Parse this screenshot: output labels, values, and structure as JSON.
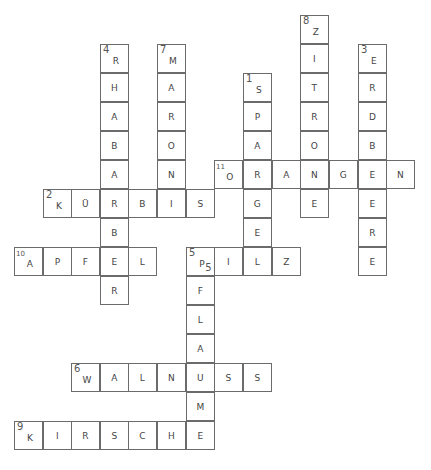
{
  "puzzle": {
    "type": "crossword",
    "grid": {
      "col_x": [
        14,
        43,
        71,
        100,
        128,
        157,
        186,
        214,
        243,
        272,
        300,
        329,
        358,
        386
      ],
      "row_y": [
        15,
        44,
        73,
        102,
        131,
        160,
        189,
        218,
        247,
        276,
        305,
        334,
        363,
        392,
        421
      ]
    },
    "words": [
      {
        "number": "1",
        "answer": "SPARGEL",
        "direction": "down",
        "start": [
          8,
          2
        ]
      },
      {
        "number": "2",
        "answer": "KÜRBIS",
        "direction": "across",
        "start": [
          1,
          6
        ]
      },
      {
        "number": "3",
        "answer": "ERDBEERE",
        "direction": "down",
        "start": [
          12,
          1
        ]
      },
      {
        "number": "4",
        "answer": "RHABARBER",
        "direction": "down",
        "start": [
          3,
          1
        ]
      },
      {
        "number": "5",
        "answer": "PILZ",
        "direction": "across",
        "start": [
          6,
          8
        ]
      },
      {
        "number": "5",
        "answer": "PFLAUME",
        "direction": "down",
        "start": [
          6,
          8
        ]
      },
      {
        "number": "6",
        "answer": "WALNUSS",
        "direction": "across",
        "start": [
          2,
          12
        ]
      },
      {
        "number": "7",
        "answer": "MARONI",
        "direction": "down",
        "start": [
          5,
          1
        ]
      },
      {
        "number": "8",
        "answer": "ZITRONE",
        "direction": "down",
        "start": [
          10,
          0
        ]
      },
      {
        "number": "9",
        "answer": "KIRSCHE",
        "direction": "across",
        "start": [
          0,
          14
        ]
      },
      {
        "number": "10",
        "answer": "APFEL",
        "direction": "across",
        "start": [
          0,
          8
        ]
      },
      {
        "number": "11",
        "answer": "ORANGEN",
        "direction": "across",
        "start": [
          7,
          5
        ]
      }
    ],
    "cells": [
      {
        "c": 10,
        "r": 0,
        "l": "Z",
        "n": "8"
      },
      {
        "c": 3,
        "r": 1,
        "l": "R",
        "n": "4"
      },
      {
        "c": 5,
        "r": 1,
        "l": "M",
        "n": "7"
      },
      {
        "c": 10,
        "r": 1,
        "l": "I"
      },
      {
        "c": 12,
        "r": 1,
        "l": "E",
        "n": "3"
      },
      {
        "c": 3,
        "r": 2,
        "l": "H"
      },
      {
        "c": 5,
        "r": 2,
        "l": "A"
      },
      {
        "c": 8,
        "r": 2,
        "l": "S",
        "n": "1"
      },
      {
        "c": 10,
        "r": 2,
        "l": "T"
      },
      {
        "c": 12,
        "r": 2,
        "l": "R"
      },
      {
        "c": 3,
        "r": 3,
        "l": "A"
      },
      {
        "c": 5,
        "r": 3,
        "l": "R"
      },
      {
        "c": 8,
        "r": 3,
        "l": "P"
      },
      {
        "c": 10,
        "r": 3,
        "l": "R"
      },
      {
        "c": 12,
        "r": 3,
        "l": "D"
      },
      {
        "c": 3,
        "r": 4,
        "l": "B"
      },
      {
        "c": 5,
        "r": 4,
        "l": "O"
      },
      {
        "c": 8,
        "r": 4,
        "l": "A"
      },
      {
        "c": 10,
        "r": 4,
        "l": "O"
      },
      {
        "c": 12,
        "r": 4,
        "l": "B"
      },
      {
        "c": 3,
        "r": 5,
        "l": "A"
      },
      {
        "c": 5,
        "r": 5,
        "l": "N"
      },
      {
        "c": 7,
        "r": 5,
        "l": "O",
        "n": "11",
        "small": true
      },
      {
        "c": 8,
        "r": 5,
        "l": "R"
      },
      {
        "c": 9,
        "r": 5,
        "l": "A"
      },
      {
        "c": 10,
        "r": 5,
        "l": "N"
      },
      {
        "c": 11,
        "r": 5,
        "l": "G"
      },
      {
        "c": 12,
        "r": 5,
        "l": "E"
      },
      {
        "c": 13,
        "r": 5,
        "l": "N"
      },
      {
        "c": 1,
        "r": 6,
        "l": "K",
        "n": "2"
      },
      {
        "c": 2,
        "r": 6,
        "l": "Ü"
      },
      {
        "c": 3,
        "r": 6,
        "l": "R"
      },
      {
        "c": 4,
        "r": 6,
        "l": "B"
      },
      {
        "c": 5,
        "r": 6,
        "l": "I"
      },
      {
        "c": 6,
        "r": 6,
        "l": "S"
      },
      {
        "c": 8,
        "r": 6,
        "l": "G"
      },
      {
        "c": 10,
        "r": 6,
        "l": "E"
      },
      {
        "c": 12,
        "r": 6,
        "l": "E"
      },
      {
        "c": 3,
        "r": 7,
        "l": "B"
      },
      {
        "c": 8,
        "r": 7,
        "l": "E"
      },
      {
        "c": 12,
        "r": 7,
        "l": "R"
      },
      {
        "c": 0,
        "r": 8,
        "l": "A",
        "n": "10",
        "small": true
      },
      {
        "c": 1,
        "r": 8,
        "l": "P"
      },
      {
        "c": 2,
        "r": 8,
        "l": "F"
      },
      {
        "c": 3,
        "r": 8,
        "l": "E"
      },
      {
        "c": 4,
        "r": 8,
        "l": "L"
      },
      {
        "c": 6,
        "r": 8,
        "l": "P",
        "n": "5",
        "n2": "5"
      },
      {
        "c": 7,
        "r": 8,
        "l": "I"
      },
      {
        "c": 8,
        "r": 8,
        "l": "L"
      },
      {
        "c": 9,
        "r": 8,
        "l": "Z"
      },
      {
        "c": 12,
        "r": 8,
        "l": "E"
      },
      {
        "c": 3,
        "r": 9,
        "l": "R"
      },
      {
        "c": 6,
        "r": 9,
        "l": "F"
      },
      {
        "c": 6,
        "r": 10,
        "l": "L"
      },
      {
        "c": 6,
        "r": 11,
        "l": "A"
      },
      {
        "c": 2,
        "r": 12,
        "l": "W",
        "n": "6"
      },
      {
        "c": 3,
        "r": 12,
        "l": "A"
      },
      {
        "c": 4,
        "r": 12,
        "l": "L"
      },
      {
        "c": 5,
        "r": 12,
        "l": "N"
      },
      {
        "c": 6,
        "r": 12,
        "l": "U"
      },
      {
        "c": 7,
        "r": 12,
        "l": "S"
      },
      {
        "c": 8,
        "r": 12,
        "l": "S"
      },
      {
        "c": 6,
        "r": 13,
        "l": "M"
      },
      {
        "c": 0,
        "r": 14,
        "l": "K",
        "n": "9"
      },
      {
        "c": 1,
        "r": 14,
        "l": "I"
      },
      {
        "c": 2,
        "r": 14,
        "l": "R"
      },
      {
        "c": 3,
        "r": 14,
        "l": "S"
      },
      {
        "c": 4,
        "r": 14,
        "l": "C"
      },
      {
        "c": 5,
        "r": 14,
        "l": "H"
      },
      {
        "c": 6,
        "r": 14,
        "l": "E"
      }
    ]
  },
  "colors": {
    "border": "#6b6b6b",
    "letter": "#444444",
    "number": "#555555",
    "background": "#ffffff"
  }
}
